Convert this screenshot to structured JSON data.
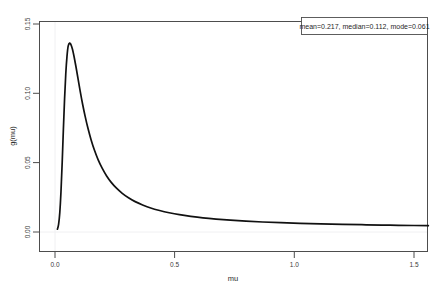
{
  "page": {
    "background": "#ffffff",
    "faint_header_text": "",
    "faint_page_number": ""
  },
  "legend": {
    "text": "mean=0.217, median=0.112, mode=0.061",
    "position": "top-right",
    "border_color": "#4d4d4d",
    "background": "#ffffff"
  },
  "chart_data": {
    "type": "line",
    "title": "",
    "subtitle": "",
    "xlabel": "mu",
    "ylabel": "g(mu)",
    "xlim": [
      -0.03,
      1.58
    ],
    "ylim": [
      -0.004,
      0.152
    ],
    "xticks": [
      0.0,
      0.5,
      1.0,
      1.5
    ],
    "xticklabels": [
      "0.0",
      "0.5",
      "1.0",
      "1.5"
    ],
    "yticks": [
      0.0,
      0.05,
      0.1,
      0.15
    ],
    "yticklabels": [
      "0.00",
      "0.05",
      "0.10",
      "0.15"
    ],
    "ytick_rotation": 90,
    "grid": false,
    "legend_position": "upper right",
    "line_color": "#111111",
    "line_width": 1.7,
    "annotations": [
      "mean=0.217, median=0.112, mode=0.061"
    ],
    "statistics": {
      "mean": 0.217,
      "median": 0.112,
      "mode": 0.061
    },
    "series": [
      {
        "name": "g(mu)",
        "x": [
          0.01,
          0.015,
          0.02,
          0.025,
          0.03,
          0.035,
          0.04,
          0.045,
          0.05,
          0.055,
          0.061,
          0.067,
          0.073,
          0.08,
          0.088,
          0.096,
          0.105,
          0.115,
          0.126,
          0.138,
          0.151,
          0.165,
          0.18,
          0.197,
          0.215,
          0.235,
          0.257,
          0.281,
          0.307,
          0.335,
          0.366,
          0.4,
          0.437,
          0.477,
          0.52,
          0.567,
          0.618,
          0.673,
          0.733,
          0.798,
          0.868,
          0.943,
          1.024,
          1.11,
          1.202,
          1.3,
          1.4,
          1.5,
          1.56
        ],
        "y": [
          0.002,
          0.0055,
          0.014,
          0.029,
          0.05,
          0.074,
          0.096,
          0.114,
          0.1265,
          0.134,
          0.1362,
          0.135,
          0.1318,
          0.1262,
          0.1188,
          0.1108,
          0.1018,
          0.0925,
          0.0834,
          0.0746,
          0.0664,
          0.0589,
          0.0522,
          0.046,
          0.0406,
          0.0358,
          0.0316,
          0.0279,
          0.0247,
          0.0219,
          0.0195,
          0.0173,
          0.0155,
          0.0139,
          0.0125,
          0.0113,
          0.0102,
          0.0093,
          0.0085,
          0.0078,
          0.0072,
          0.0067,
          0.0062,
          0.0058,
          0.0055,
          0.0052,
          0.0049,
          0.0047,
          0.0046
        ]
      }
    ]
  }
}
